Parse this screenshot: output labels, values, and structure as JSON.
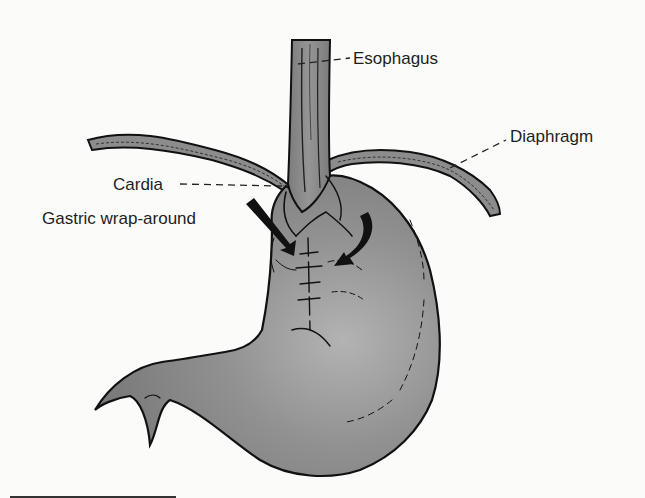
{
  "figure": {
    "labels": {
      "esophagus": "Esophagus",
      "diaphragm": "Diaphragm",
      "cardia": "Cardia",
      "gastric_wrap": "Gastric wrap-around"
    },
    "colors": {
      "background": "#fbfbfa",
      "tissue": "#8a8a8a",
      "tissue_highlight": "#b5b5b5",
      "outline": "#111111",
      "text": "#1e1e1e"
    }
  }
}
